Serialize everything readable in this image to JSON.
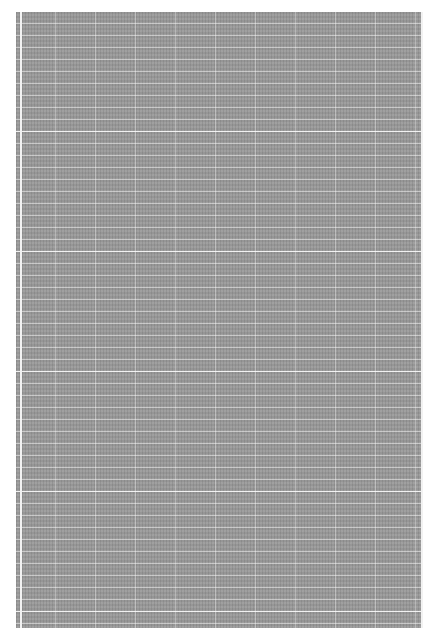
{
  "document": {
    "description": "Dense illegible text/table content rendered at very small scale on a gray background with white grid lines",
    "background_color": "#9a9a9a",
    "grid_line_color": "#ffffff",
    "legible_text": ""
  }
}
